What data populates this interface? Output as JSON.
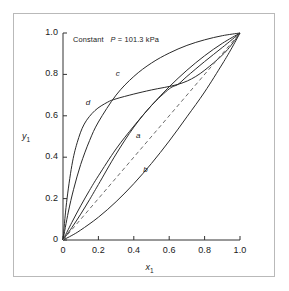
{
  "chart_data": {
    "type": "line",
    "title": "",
    "annotation": "Constant  P = 101.3 kPa",
    "annotation_prefix": "Constant",
    "annotation_symbol": "P",
    "annotation_value": "= 101.3 kPa",
    "xlabel": "x",
    "xlabel_sub": "1",
    "ylabel": "y",
    "ylabel_sub": "1",
    "xlim": [
      0,
      1.0
    ],
    "ylim": [
      0,
      1.0
    ],
    "grid": false,
    "legend": "none",
    "xticks": [
      "0",
      "0.2",
      "0.4",
      "0.6",
      "0.8",
      "1.0"
    ],
    "xtick_values": [
      0,
      0.2,
      0.4,
      0.6,
      0.8,
      1.0
    ],
    "yticks": [
      "0",
      "0.2",
      "0.4",
      "0.6",
      "0.8",
      "1.0"
    ],
    "ytick_values": [
      0,
      0.2,
      0.4,
      0.6,
      0.8,
      1.0
    ],
    "reference_line": {
      "name": "diagonal",
      "style": "dashed",
      "x": [
        0,
        1.0
      ],
      "y": [
        0,
        1.0
      ]
    },
    "series": [
      {
        "name": "a",
        "label": "a",
        "style": "solid",
        "label_x": 0.43,
        "label_y": 0.5,
        "x": [
          0.0,
          0.05,
          0.1,
          0.15,
          0.2,
          0.3,
          0.4,
          0.5,
          0.6,
          0.7,
          0.8,
          0.9,
          1.0
        ],
        "y": [
          0.0,
          0.085,
          0.165,
          0.24,
          0.31,
          0.44,
          0.55,
          0.65,
          0.74,
          0.82,
          0.89,
          0.95,
          1.0
        ]
      },
      {
        "name": "b",
        "label": "b",
        "style": "solid",
        "label_x": 0.47,
        "label_y": 0.335,
        "x": [
          0.0,
          0.05,
          0.1,
          0.2,
          0.3,
          0.4,
          0.5,
          0.6,
          0.7,
          0.8,
          0.9,
          0.95,
          1.0
        ],
        "y": [
          0.0,
          0.022,
          0.048,
          0.11,
          0.185,
          0.272,
          0.37,
          0.478,
          0.595,
          0.715,
          0.85,
          0.922,
          1.0
        ]
      },
      {
        "name": "c",
        "label": "c",
        "style": "solid",
        "label_x": 0.315,
        "label_y": 0.795,
        "x": [
          0.0,
          0.03,
          0.06,
          0.1,
          0.15,
          0.2,
          0.3,
          0.4,
          0.5,
          0.6,
          0.7,
          0.8,
          0.9,
          1.0
        ],
        "y": [
          0.0,
          0.135,
          0.245,
          0.365,
          0.48,
          0.57,
          0.7,
          0.79,
          0.855,
          0.903,
          0.94,
          0.967,
          0.987,
          1.0
        ]
      },
      {
        "name": "d",
        "label": "d",
        "style": "solid",
        "label_x": 0.145,
        "label_y": 0.655,
        "x": [
          0.0,
          0.02,
          0.05,
          0.08,
          0.12,
          0.18,
          0.25,
          0.3,
          0.4,
          0.5,
          0.65,
          0.75,
          0.85,
          0.93,
          1.0
        ],
        "y": [
          0.0,
          0.18,
          0.36,
          0.47,
          0.56,
          0.625,
          0.665,
          0.682,
          0.705,
          0.725,
          0.752,
          0.79,
          0.855,
          0.92,
          1.0
        ]
      },
      {
        "name": "e",
        "label": "",
        "style": "solid",
        "label_x": null,
        "label_y": null,
        "x": [
          0.0,
          0.05,
          0.1,
          0.15,
          0.2,
          0.3,
          0.4,
          0.5,
          0.6,
          0.65,
          0.7,
          0.8,
          0.9,
          1.0
        ],
        "y": [
          0.0,
          0.06,
          0.125,
          0.195,
          0.268,
          0.415,
          0.545,
          0.65,
          0.73,
          0.752,
          0.79,
          0.862,
          0.93,
          1.0
        ]
      }
    ]
  }
}
